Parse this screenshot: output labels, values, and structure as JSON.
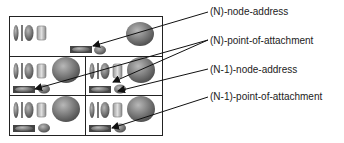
{
  "diagram": {
    "labels": [
      {
        "id": "n-node-address",
        "text": "(N)-node-address",
        "x": 210,
        "y": 6
      },
      {
        "id": "n-point-of-attachment",
        "text": "(N)-point-of-attachment",
        "x": 210,
        "y": 35
      },
      {
        "id": "n1-node-address",
        "text": "(N-1)-node-address",
        "x": 210,
        "y": 64
      },
      {
        "id": "n1-point-of-attachment",
        "text": "(N-1)-point-of-attachment",
        "x": 210,
        "y": 91
      }
    ],
    "colors": {
      "stroke": "#222222",
      "shape_fill_dark": "#5a5a5a",
      "shape_fill_light": "#bdbdbd",
      "background": "#ffffff"
    }
  }
}
